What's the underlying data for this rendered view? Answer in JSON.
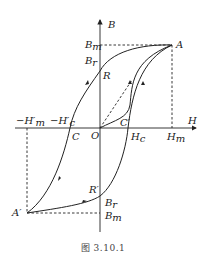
{
  "figure": {
    "caption": "图 3.10.1",
    "type": "magnetic hysteresis loop (B-H curve)"
  },
  "axes": {
    "x_label": "H",
    "y_label": "B",
    "origin_label": "O"
  },
  "labels": {
    "A": "A",
    "A_prime": "A′",
    "R": "R",
    "R_prime": "R′",
    "C": "C",
    "C_prime": "C′",
    "Bm_top": "B",
    "Bm_top_sub": "m",
    "Br_top": "B",
    "Br_top_sub": "r",
    "Br_bottom": "B",
    "Br_bottom_sub": "r",
    "Bm_bottom": "B",
    "Bm_bottom_sub": "m",
    "Hm": "H",
    "Hm_sub": "m",
    "Hc": "H",
    "Hc_sub": "c",
    "neg_Hm": "−H′",
    "neg_Hm_sub": "m",
    "neg_Hc": "−H′",
    "neg_Hc_sub": "c"
  },
  "colors": {
    "line": "#222222",
    "background": "#ffffff"
  }
}
